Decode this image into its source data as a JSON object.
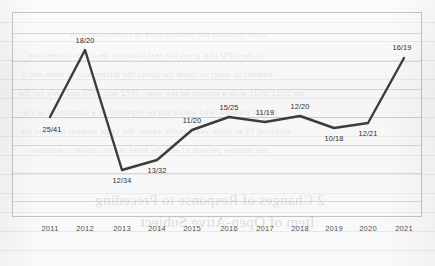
{
  "chart_data": {
    "type": "line",
    "title": "",
    "subtitle": "",
    "xlabel": "",
    "ylabel": "",
    "grid": true,
    "legend": "none",
    "categories": [
      "2011",
      "2012",
      "2013",
      "2014",
      "2015",
      "2016",
      "2017",
      "2018",
      "2019",
      "2020",
      "2021"
    ],
    "point_labels": [
      "25/41",
      "18/20",
      "12/34",
      "13/32",
      "11/20",
      "15/25",
      "11/19",
      "12/20",
      "10/18",
      "12/21",
      "16/19"
    ],
    "series": [
      {
        "name": "ratio",
        "values": [
          0.61,
          0.9,
          0.353,
          0.406,
          0.55,
          0.6,
          0.579,
          0.6,
          0.556,
          0.571,
          0.842
        ],
        "numerators": [
          25,
          18,
          12,
          13,
          11,
          15,
          11,
          12,
          10,
          12,
          16
        ],
        "denominators": [
          41,
          20,
          34,
          32,
          20,
          25,
          19,
          20,
          18,
          21,
          19
        ],
        "color": "#3c3c3c"
      }
    ],
    "ylim": [
      0.3,
      0.95
    ],
    "label_positions": [
      "below",
      "above",
      "below",
      "below",
      "above",
      "above",
      "above",
      "above",
      "below",
      "below",
      "above"
    ],
    "points_px": [
      {
        "x": 38,
        "y": 105
      },
      {
        "x": 73,
        "y": 38
      },
      {
        "x": 110,
        "y": 158
      },
      {
        "x": 145,
        "y": 148
      },
      {
        "x": 180,
        "y": 118
      },
      {
        "x": 217,
        "y": 105
      },
      {
        "x": 253,
        "y": 110
      },
      {
        "x": 288,
        "y": 104
      },
      {
        "x": 322,
        "y": 116
      },
      {
        "x": 356,
        "y": 111
      },
      {
        "x": 392,
        "y": 46
      }
    ]
  },
  "background": {
    "paper_color": "#f7f7f7",
    "line_color": "#3c3c3c",
    "frame_color": "#7a7a80",
    "ghost_lines": [
      {
        "text": "some function the relation used in connection with",
        "x": 70,
        "y": 29,
        "size": 9
      },
      {
        "text": "of the GPU that gives the real situation describes connection",
        "x": 28,
        "y": 50,
        "size": 9
      },
      {
        "text": "number or analysis room the affect the differences in table and a",
        "x": 22,
        "y": 69,
        "size": 9
      },
      {
        "text": "the 2021/2021 with a section on the years 1972 and 1973 and only for the",
        "x": 18,
        "y": 88,
        "size": 9
      },
      {
        "text": "the all students who would not be expected as a conclusion of the",
        "x": 22,
        "y": 107,
        "size": 9
      },
      {
        "text": "received 19 as those years really easier, the same number indicate the",
        "x": 20,
        "y": 126,
        "size": 9
      },
      {
        "text": "the number periods of and the level the its similar conditions",
        "x": 30,
        "y": 145,
        "size": 9
      },
      {
        "text": "2  Changes of Response to Preceding",
        "x": 95,
        "y": 192,
        "size": 15
      },
      {
        "text": "Item of Open-Ative Subject",
        "x": 140,
        "y": 214,
        "size": 15
      }
    ]
  }
}
